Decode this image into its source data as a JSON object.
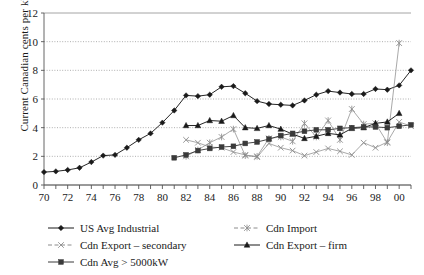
{
  "chart_data": {
    "type": "line",
    "title": "",
    "xlabel": "",
    "ylabel": "Current Canadian cents per kWh",
    "xlim": [
      1970,
      2001
    ],
    "ylim": [
      0,
      12
    ],
    "ytick_step": 2,
    "xtick_step": 2,
    "grid": true,
    "legend_position": "bottom",
    "x": [
      1970,
      1971,
      1972,
      1973,
      1974,
      1975,
      1976,
      1977,
      1978,
      1979,
      1980,
      1981,
      1982,
      1983,
      1984,
      1985,
      1986,
      1987,
      1988,
      1989,
      1990,
      1991,
      1992,
      1993,
      1994,
      1995,
      1996,
      1997,
      1998,
      1999,
      2000,
      2001
    ],
    "ytick_labels": [
      "0",
      "2",
      "4",
      "6",
      "8",
      "10",
      "12"
    ],
    "xtick_labels": [
      "70",
      "72",
      "74",
      "76",
      "78",
      "80",
      "82",
      "84",
      "86",
      "88",
      "90",
      "92",
      "94",
      "96",
      "98",
      "00"
    ],
    "series": [
      {
        "name": "US Avg Industrial",
        "marker": "diamond",
        "color": "#1a1a1a",
        "x": [
          1970,
          1971,
          1972,
          1973,
          1974,
          1975,
          1976,
          1977,
          1978,
          1979,
          1980,
          1981,
          1982,
          1983,
          1984,
          1985,
          1986,
          1987,
          1988,
          1989,
          1990,
          1991,
          1992,
          1993,
          1994,
          1995,
          1996,
          1997,
          1998,
          1999,
          2000,
          2001
        ],
        "values": [
          0.9,
          0.95,
          1.05,
          1.2,
          1.6,
          2.05,
          2.1,
          2.6,
          3.15,
          3.6,
          4.35,
          5.2,
          6.25,
          6.2,
          6.3,
          6.85,
          6.9,
          6.4,
          5.85,
          5.65,
          5.6,
          5.55,
          5.9,
          6.3,
          6.55,
          6.45,
          6.35,
          6.35,
          6.7,
          6.65,
          6.95,
          8.0
        ]
      },
      {
        "name": "Cdn Import",
        "marker": "asterisk",
        "color": "#8c8c8c",
        "x": [
          1982,
          1983,
          1984,
          1985,
          1986,
          1987,
          1988,
          1989,
          1990,
          1991,
          1992,
          1993,
          1994,
          1995,
          1996,
          1997,
          1998,
          1999,
          2000
        ],
        "values": [
          2.0,
          2.45,
          2.95,
          3.35,
          3.9,
          2.05,
          2.0,
          3.25,
          3.35,
          3.05,
          4.3,
          3.35,
          4.5,
          3.15,
          5.3,
          4.25,
          4.3,
          2.95,
          9.9
        ]
      },
      {
        "name": "Cdn Export – secondary",
        "marker": "cross",
        "color": "#8c8c8c",
        "x": [
          1982,
          1983,
          1984,
          1985,
          1986,
          1987,
          1988,
          1989,
          1990,
          1991,
          1992,
          1993,
          1994,
          1995,
          1996,
          1997,
          1998,
          1999,
          2000,
          2001
        ],
        "values": [
          3.15,
          2.95,
          2.65,
          2.6,
          2.3,
          2.1,
          1.95,
          2.9,
          2.6,
          2.4,
          2.05,
          2.3,
          2.55,
          2.35,
          2.1,
          2.95,
          2.6,
          3.0,
          4.4,
          4.1
        ]
      },
      {
        "name": "Cdn Export – firm",
        "marker": "triangle",
        "color": "#1a1a1a",
        "x": [
          1982,
          1983,
          1984,
          1985,
          1986,
          1987,
          1988,
          1989,
          1990,
          1991,
          1992,
          1993,
          1994,
          1995,
          1996,
          1997,
          1998,
          1999,
          2000
        ],
        "values": [
          4.15,
          4.15,
          4.5,
          4.45,
          4.85,
          4.0,
          3.95,
          4.15,
          3.9,
          3.55,
          3.25,
          3.4,
          3.6,
          3.5,
          3.95,
          4.0,
          4.3,
          4.4,
          5.0
        ]
      },
      {
        "name": "Cdn Avg > 5000kW",
        "marker": "square",
        "color": "#3a3a3a",
        "x": [
          1981,
          1982,
          1983,
          1984,
          1985,
          1986,
          1987,
          1988,
          1989,
          1990,
          1991,
          1992,
          1993,
          1994,
          1995,
          1996,
          1997,
          1998,
          1999,
          2000,
          2001
        ],
        "values": [
          1.9,
          2.1,
          2.4,
          2.55,
          2.65,
          2.7,
          2.9,
          3.0,
          3.2,
          3.45,
          3.6,
          3.75,
          3.85,
          3.85,
          3.95,
          4.0,
          4.05,
          4.05,
          4.0,
          4.1,
          4.2
        ]
      }
    ]
  },
  "legend": {
    "entries": [
      {
        "label": "US Avg Industrial",
        "marker": "diamond"
      },
      {
        "label": "Cdn Import",
        "marker": "asterisk"
      },
      {
        "label": "Cdn Export – secondary",
        "marker": "cross"
      },
      {
        "label": "Cdn Export – firm",
        "marker": "triangle"
      },
      {
        "label": "Cdn Avg > 5000kW",
        "marker": "square"
      }
    ]
  }
}
